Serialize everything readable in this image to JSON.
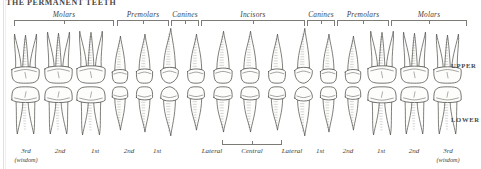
{
  "plate": {
    "title": "THE PERMANENT TEETH",
    "background_color": "#ffffff",
    "ink_color": "#3b3a36"
  },
  "side_labels": {
    "upper": "UPPER",
    "lower": "LOWER"
  },
  "group_labels": [
    {
      "id": "molars-left",
      "label": "Molars",
      "left": 14,
      "width": 100,
      "count": 3
    },
    {
      "id": "premolars-left",
      "label": "Premolars",
      "left": 117,
      "width": 52,
      "count": 2
    },
    {
      "id": "canines-left",
      "label": "Canines",
      "left": 171,
      "width": 28,
      "count": 1
    },
    {
      "id": "incisors",
      "label": "Incisors",
      "left": 201,
      "width": 104,
      "count": 4
    },
    {
      "id": "canines-right",
      "label": "Canines",
      "left": 307,
      "width": 28,
      "count": 1
    },
    {
      "id": "premolars-right",
      "label": "Premolars",
      "left": 337,
      "width": 52,
      "count": 2
    },
    {
      "id": "molars-right",
      "label": "Molars",
      "left": 391,
      "width": 76,
      "count": 3
    }
  ],
  "central_bracket": {
    "label": "",
    "left": 222,
    "width": 60
  },
  "tooth_captions": [
    {
      "main": "3rd",
      "sub": "(wisdom)",
      "center": 26
    },
    {
      "main": "2nd",
      "sub": "",
      "center": 60
    },
    {
      "main": "1st",
      "sub": "",
      "center": 95
    },
    {
      "main": "2nd",
      "sub": "",
      "center": 129
    },
    {
      "main": "1st",
      "sub": "",
      "center": 157
    },
    {
      "main": "Lateral",
      "sub": "",
      "center": 212
    },
    {
      "main": "Central",
      "sub": "",
      "center": 252
    },
    {
      "main": "Lateral",
      "sub": "",
      "center": 292
    },
    {
      "main": "1st",
      "sub": "",
      "center": 320
    },
    {
      "main": "2nd",
      "sub": "",
      "center": 348
    },
    {
      "main": "1st",
      "sub": "",
      "center": 381
    },
    {
      "main": "2nd",
      "sub": "",
      "center": 414
    },
    {
      "main": "3rd",
      "sub": "(wisdom)",
      "center": 448
    }
  ],
  "arches": {
    "upper": {
      "name": "UPPER",
      "root_direction": "up",
      "teeth": [
        {
          "type": "molar",
          "roots": 3,
          "w": 31,
          "h": 52
        },
        {
          "type": "molar",
          "roots": 3,
          "w": 31,
          "h": 54
        },
        {
          "type": "molar",
          "roots": 3,
          "w": 32,
          "h": 55
        },
        {
          "type": "premolar",
          "roots": 1,
          "w": 22,
          "h": 50
        },
        {
          "type": "premolar",
          "roots": 1,
          "w": 23,
          "h": 52
        },
        {
          "type": "canine",
          "roots": 1,
          "w": 25,
          "h": 58
        },
        {
          "type": "incisor",
          "roots": 1,
          "w": 24,
          "h": 52
        },
        {
          "type": "incisor",
          "roots": 1,
          "w": 26,
          "h": 55
        },
        {
          "type": "incisor",
          "roots": 1,
          "w": 26,
          "h": 55
        },
        {
          "type": "incisor",
          "roots": 1,
          "w": 24,
          "h": 52
        },
        {
          "type": "canine",
          "roots": 1,
          "w": 25,
          "h": 58
        },
        {
          "type": "premolar",
          "roots": 1,
          "w": 23,
          "h": 52
        },
        {
          "type": "premolar",
          "roots": 1,
          "w": 22,
          "h": 50
        },
        {
          "type": "molar",
          "roots": 3,
          "w": 32,
          "h": 55
        },
        {
          "type": "molar",
          "roots": 3,
          "w": 31,
          "h": 54
        },
        {
          "type": "molar",
          "roots": 3,
          "w": 31,
          "h": 52
        }
      ]
    },
    "lower": {
      "name": "LOWER",
      "root_direction": "down",
      "teeth": [
        {
          "type": "molar",
          "roots": 2,
          "w": 31,
          "h": 50
        },
        {
          "type": "molar",
          "roots": 2,
          "w": 31,
          "h": 50
        },
        {
          "type": "molar",
          "roots": 2,
          "w": 32,
          "h": 51
        },
        {
          "type": "premolar",
          "roots": 1,
          "w": 22,
          "h": 46
        },
        {
          "type": "premolar",
          "roots": 1,
          "w": 23,
          "h": 48
        },
        {
          "type": "canine",
          "roots": 1,
          "w": 25,
          "h": 52
        },
        {
          "type": "incisor",
          "roots": 1,
          "w": 24,
          "h": 46
        },
        {
          "type": "incisor",
          "roots": 1,
          "w": 26,
          "h": 48
        },
        {
          "type": "incisor",
          "roots": 1,
          "w": 26,
          "h": 48
        },
        {
          "type": "incisor",
          "roots": 1,
          "w": 24,
          "h": 46
        },
        {
          "type": "canine",
          "roots": 1,
          "w": 25,
          "h": 52
        },
        {
          "type": "premolar",
          "roots": 1,
          "w": 23,
          "h": 48
        },
        {
          "type": "premolar",
          "roots": 1,
          "w": 22,
          "h": 46
        },
        {
          "type": "molar",
          "roots": 2,
          "w": 32,
          "h": 51
        },
        {
          "type": "molar",
          "roots": 2,
          "w": 31,
          "h": 50
        },
        {
          "type": "molar",
          "roots": 2,
          "w": 31,
          "h": 50
        }
      ]
    }
  }
}
